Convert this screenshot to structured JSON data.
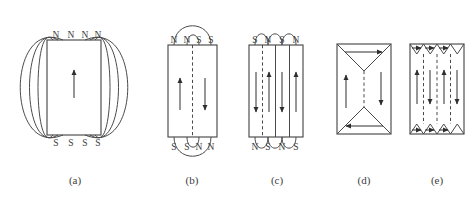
{
  "figure": {
    "background_color": "#ffffff",
    "line_color": "#4a4a4a",
    "arrow_color": "#2e2e2e",
    "width": 474,
    "height": 199,
    "panels": [
      {
        "id": "a",
        "caption": "(a)",
        "caption_x": 75,
        "caption_y": 184,
        "description": "single domain with external stray field lines",
        "rect": {
          "x": 47,
          "y": 40,
          "w": 54,
          "h": 95
        },
        "top_poles": [
          "N",
          "N",
          "N",
          "N"
        ],
        "bottom_poles": [
          "S",
          "S",
          "S",
          "S"
        ],
        "pole_xs": [
          56,
          71,
          85,
          98
        ],
        "top_pole_y": 38,
        "bottom_pole_y": 146,
        "domain_arrows": [
          {
            "x": 74,
            "y1": 98,
            "y2": 70,
            "dir": "up"
          }
        ],
        "field_loops": [
          {
            "side": "left",
            "bulge": 14
          },
          {
            "side": "left",
            "bulge": 27
          },
          {
            "side": "left",
            "bulge": 41
          },
          {
            "side": "right",
            "bulge": 14
          },
          {
            "side": "right",
            "bulge": 27
          },
          {
            "side": "right",
            "bulge": 41
          }
        ]
      },
      {
        "id": "b",
        "caption": "(b)",
        "caption_x": 192,
        "caption_y": 184,
        "description": "two antiparallel domains with reduced stray field",
        "rect": {
          "x": 168,
          "y": 45,
          "w": 49,
          "h": 92
        },
        "top_poles": [
          "N",
          "N",
          "S",
          "S"
        ],
        "bottom_poles": [
          "S",
          "S",
          "N",
          "N"
        ],
        "pole_xs": [
          174,
          187,
          199,
          211
        ],
        "top_pole_y": 43,
        "bottom_pole_y": 150,
        "walls": [
          {
            "x": 192.5,
            "style": "dashed"
          }
        ],
        "domain_arrows": [
          {
            "x": 180,
            "y1": 110,
            "y2": 78,
            "dir": "up"
          },
          {
            "x": 205,
            "y1": 78,
            "y2": 110,
            "dir": "down"
          }
        ],
        "top_arcs": [
          {
            "x1": 174,
            "x2": 211,
            "rise": 19
          },
          {
            "x1": 187,
            "x2": 199,
            "rise": 10
          }
        ],
        "bottom_arcs": [
          {
            "x1": 174,
            "x2": 211,
            "rise": 19
          },
          {
            "x1": 187,
            "x2": 199,
            "rise": 10
          }
        ]
      },
      {
        "id": "c",
        "caption": "(c)",
        "caption_x": 277,
        "caption_y": 184,
        "description": "four alternating domains with small surface flux loops",
        "rect": {
          "x": 249,
          "y": 45,
          "w": 54,
          "h": 92
        },
        "top_poles": [
          "S",
          "N",
          "S",
          "N"
        ],
        "bottom_poles": [
          "N",
          "S",
          "N",
          "S"
        ],
        "pole_xs": [
          255,
          268,
          282,
          296
        ],
        "top_pole_y": 43,
        "bottom_pole_y": 150,
        "walls": [
          {
            "x": 262.5,
            "style": "dashed"
          },
          {
            "x": 275.5,
            "style": "solid"
          },
          {
            "x": 289.5,
            "style": "solid"
          }
        ],
        "domain_arrows": [
          {
            "x": 256,
            "y1": 72,
            "y2": 112,
            "dir": "down"
          },
          {
            "x": 269,
            "y1": 112,
            "y2": 72,
            "dir": "up"
          },
          {
            "x": 282,
            "y1": 72,
            "y2": 112,
            "dir": "down"
          },
          {
            "x": 296,
            "y1": 112,
            "y2": 72,
            "dir": "up"
          }
        ],
        "top_arcs": [
          {
            "x1": 255,
            "x2": 268,
            "rise": 11
          },
          {
            "x1": 268,
            "x2": 282,
            "rise": 11
          },
          {
            "x1": 282,
            "x2": 296,
            "rise": 11
          }
        ],
        "bottom_arcs": [
          {
            "x1": 255,
            "x2": 268,
            "rise": 11
          },
          {
            "x1": 268,
            "x2": 282,
            "rise": 11
          },
          {
            "x1": 282,
            "x2": 296,
            "rise": 11
          }
        ]
      },
      {
        "id": "d",
        "caption": "(d)",
        "caption_x": 364,
        "caption_y": 184,
        "description": "flux closure with two triangular closure domains",
        "rect": {
          "x": 337,
          "y": 44,
          "w": 54,
          "h": 90
        },
        "walls": [
          {
            "x": 364,
            "style": "dashed",
            "y1": 71,
            "y2": 107
          }
        ],
        "closure_lines": [
          {
            "x1": 337,
            "y1": 44,
            "x2": 364,
            "y2": 71
          },
          {
            "x1": 391,
            "y1": 44,
            "x2": 364,
            "y2": 71
          },
          {
            "x1": 337,
            "y1": 134,
            "x2": 364,
            "y2": 107
          },
          {
            "x1": 391,
            "y1": 134,
            "x2": 364,
            "y2": 107
          }
        ],
        "domain_arrows": [
          {
            "x": 346,
            "y1": 108,
            "y2": 75,
            "dir": "up"
          },
          {
            "x": 381,
            "y1": 72,
            "y2": 105,
            "dir": "down"
          }
        ],
        "horizontal_arrows": [
          {
            "y": 52,
            "x1": 345,
            "x2": 382,
            "dir": "right"
          },
          {
            "y": 126,
            "x1": 383,
            "x2": 346,
            "dir": "left"
          }
        ]
      },
      {
        "id": "e",
        "caption": "(e)",
        "caption_x": 437,
        "caption_y": 184,
        "description": "multiple domains with triangular closure domains top and bottom",
        "rect": {
          "x": 410,
          "y": 44,
          "w": 54,
          "h": 90
        },
        "walls": [
          {
            "x": 423.5,
            "style": "dashed",
            "y1": 54,
            "y2": 124
          },
          {
            "x": 437,
            "style": "dashed",
            "y1": 54,
            "y2": 124
          },
          {
            "x": 450.5,
            "style": "dashed",
            "y1": 54,
            "y2": 124
          }
        ],
        "closure_zigzag_top_y": 44,
        "closure_zigzag_top_depth": 10,
        "closure_zigzag_bottom_y": 134,
        "closure_zigzag_bottom_depth": 10,
        "zigzag_xs": [
          410,
          423.5,
          437,
          450.5,
          464
        ],
        "domain_arrows": [
          {
            "x": 417,
            "y1": 104,
            "y2": 70,
            "dir": "up"
          },
          {
            "x": 430,
            "y1": 70,
            "y2": 104,
            "dir": "down"
          },
          {
            "x": 444,
            "y1": 104,
            "y2": 70,
            "dir": "up"
          },
          {
            "x": 457,
            "y1": 70,
            "y2": 104,
            "dir": "down"
          }
        ],
        "closure_arrows_top": [
          {
            "x1": 412,
            "x2": 421,
            "y": 48,
            "dir": "right"
          },
          {
            "x1": 425,
            "x2": 434,
            "y": 48,
            "dir": "right"
          },
          {
            "x1": 439,
            "x2": 448,
            "y": 48,
            "dir": "right"
          }
        ],
        "closure_arrows_bottom": [
          {
            "x1": 412,
            "x2": 421,
            "y": 130,
            "dir": "right"
          },
          {
            "x1": 425,
            "x2": 434,
            "y": 130,
            "dir": "right"
          },
          {
            "x1": 439,
            "x2": 448,
            "y": 130,
            "dir": "right"
          }
        ]
      }
    ]
  }
}
